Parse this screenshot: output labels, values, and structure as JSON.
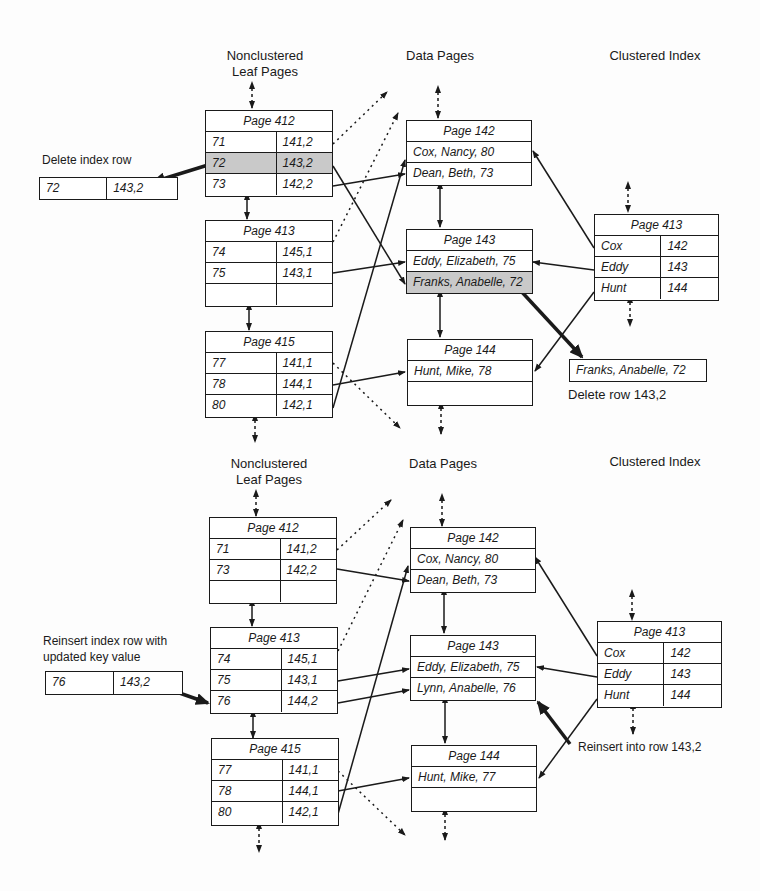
{
  "colors": {
    "ink": "#1a1a1a",
    "highlight": "#c9c9c9",
    "background": "#fdfdfd"
  },
  "top": {
    "headings": {
      "nonclustered": "Nonclustered\nLeaf Pages",
      "data": "Data Pages",
      "clustered": "Clustered Index"
    },
    "annotation_delete_index": "Delete index row",
    "annotation_delete_row": "Delete row 143,2",
    "removed_index_row": {
      "key": "72",
      "rid": "143,2"
    },
    "removed_data_row": "Franks, Anabelle, 72",
    "nc_pages": [
      {
        "title": "Page 412",
        "rows": [
          {
            "key": "71",
            "rid": "141,2"
          },
          {
            "key": "72",
            "rid": "143,2"
          },
          {
            "key": "73",
            "rid": "142,2"
          }
        ]
      },
      {
        "title": "Page 413",
        "rows": [
          {
            "key": "74",
            "rid": "145,1"
          },
          {
            "key": "75",
            "rid": "143,1"
          },
          {
            "key": "",
            "rid": ""
          }
        ]
      },
      {
        "title": "Page 415",
        "rows": [
          {
            "key": "77",
            "rid": "141,1"
          },
          {
            "key": "78",
            "rid": "144,1"
          },
          {
            "key": "80",
            "rid": "142,1"
          }
        ]
      }
    ],
    "data_pages": [
      {
        "title": "Page 142",
        "rows": [
          "Cox, Nancy, 80",
          "Dean, Beth, 73"
        ]
      },
      {
        "title": "Page 143",
        "rows": [
          "Eddy, Elizabeth, 75",
          "Franks, Anabelle, 72"
        ]
      },
      {
        "title": "Page 144",
        "rows": [
          "Hunt, Mike, 78",
          ""
        ]
      }
    ],
    "clustered_page": {
      "title": "Page 413",
      "rows": [
        {
          "key": "Cox",
          "page": "142"
        },
        {
          "key": "Eddy",
          "page": "143"
        },
        {
          "key": "Hunt",
          "page": "144"
        }
      ]
    }
  },
  "bottom": {
    "headings": {
      "nonclustered": "Nonclustered\nLeaf Pages",
      "data": "Data Pages",
      "clustered": "Clustered Index"
    },
    "annotation_reinsert_index": "Reinsert index row with\nupdated key value",
    "annotation_reinsert_row": "Reinsert into row 143,2",
    "new_index_row": {
      "key": "76",
      "rid": "143,2"
    },
    "nc_pages": [
      {
        "title": "Page 412",
        "rows": [
          {
            "key": "71",
            "rid": "141,2"
          },
          {
            "key": "73",
            "rid": "142,2"
          },
          {
            "key": "",
            "rid": ""
          }
        ]
      },
      {
        "title": "Page 413",
        "rows": [
          {
            "key": "74",
            "rid": "145,1"
          },
          {
            "key": "75",
            "rid": "143,1"
          },
          {
            "key": "76",
            "rid": "144,2"
          }
        ]
      },
      {
        "title": "Page 415",
        "rows": [
          {
            "key": "77",
            "rid": "141,1"
          },
          {
            "key": "78",
            "rid": "144,1"
          },
          {
            "key": "80",
            "rid": "142,1"
          }
        ]
      }
    ],
    "data_pages": [
      {
        "title": "Page 142",
        "rows": [
          "Cox, Nancy, 80",
          "Dean, Beth, 73"
        ]
      },
      {
        "title": "Page 143",
        "rows": [
          "Eddy, Elizabeth, 75",
          "Lynn, Anabelle, 76"
        ]
      },
      {
        "title": "Page 144",
        "rows": [
          "Hunt, Mike, 77",
          ""
        ]
      }
    ],
    "clustered_page": {
      "title": "Page 413",
      "rows": [
        {
          "key": "Cox",
          "page": "142"
        },
        {
          "key": "Eddy",
          "page": "143"
        },
        {
          "key": "Hunt",
          "page": "144"
        }
      ]
    }
  }
}
